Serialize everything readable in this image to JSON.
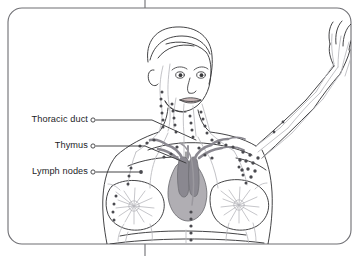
{
  "figure": {
    "type": "anatomical-illustration",
    "view": "anterior upper body, left arm raised",
    "frame": {
      "style": "rounded-rectangle",
      "border_color": "#6e6e73",
      "tick_marks": [
        "top-center",
        "bottom-center"
      ]
    },
    "palette": {
      "background": "#ffffff",
      "outline": "#3a3a3c",
      "vessel": "#b8b8bd",
      "node": "#4a4a4f",
      "thymus_body": "#b0aeb3",
      "thymus_lobe": "#8a8890",
      "label_text": "#1d1d1f",
      "leader_line": "#3a3a3c"
    }
  },
  "labels": [
    {
      "id": "thoracic-duct",
      "text": "Thoracic duct",
      "marker": "open-circle",
      "target": "base of neck, left supraclavicular region"
    },
    {
      "id": "thymus",
      "text": "Thymus",
      "marker": "open-circle",
      "target": "mediastinum, behind sternum"
    },
    {
      "id": "lymph-nodes",
      "text": "Lymph nodes",
      "marker": "open-circle",
      "target": "axillary and cervical node chains"
    }
  ],
  "structures": [
    "cervical lymph node chain",
    "axillary lymph node cluster",
    "parasternal lymph node chain",
    "thymus gland",
    "thoracic duct",
    "breast lymphatic plexus",
    "arm lymphatic vessels"
  ]
}
